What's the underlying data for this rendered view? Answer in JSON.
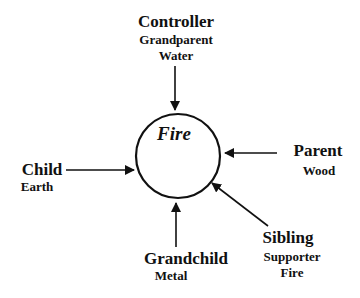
{
  "diagram": {
    "center": {
      "label": "Fire"
    },
    "nodes": {
      "controller": {
        "role": "Controller",
        "relation": "Grandparent",
        "element": "Water"
      },
      "parent": {
        "role": "Parent",
        "element": "Wood"
      },
      "child": {
        "role": "Child",
        "element": "Earth"
      },
      "grandchild": {
        "role": "Grandchild",
        "element": "Metal"
      },
      "sibling": {
        "role": "Sibling",
        "relation": "Supporter",
        "element": "Fire"
      }
    },
    "colors": {
      "stroke": "#111111",
      "background": "#ffffff"
    }
  }
}
